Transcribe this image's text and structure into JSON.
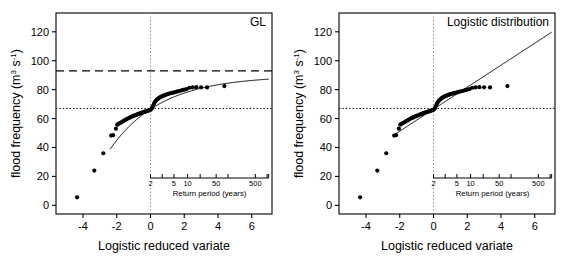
{
  "figure": {
    "width": 566,
    "height": 264,
    "background": "#ffffff",
    "foreground": "#000000"
  },
  "chart_data": [
    {
      "type": "scatter",
      "id": "panel-gl",
      "title": "GL",
      "xlabel": "Logistic reduced variate",
      "ylabel": "flood frequency (m3 s-1)",
      "ylabel_parts": {
        "lead": "flood frequency (m",
        "sup1": "3",
        "mid": " s",
        "sup2": "-1",
        "tail": ")"
      },
      "xlim": [
        -5.6,
        7.2
      ],
      "ylim": [
        -6,
        133
      ],
      "xticks": [
        -4,
        -2,
        0,
        2,
        4,
        6
      ],
      "xticklabels": [
        "-4",
        "-2",
        "0",
        "2",
        "4",
        "6"
      ],
      "yticks": [
        0,
        20,
        40,
        60,
        80,
        100,
        120
      ],
      "yticklabels": [
        "0",
        "20",
        "40",
        "60",
        "80",
        "100",
        "120"
      ],
      "grid": false,
      "legend": "none",
      "reference_lines": [
        {
          "name": "design-flood-dashed",
          "orient": "horizontal",
          "value": 93,
          "style": "dashed"
        },
        {
          "name": "median-flood-dotted",
          "orient": "horizontal",
          "value": 67,
          "style": "dotted"
        },
        {
          "name": "zero-variate-vertical",
          "orient": "vertical",
          "value": 0,
          "style": "dotted"
        }
      ],
      "points": [
        [
          -4.35,
          5.5
        ],
        [
          -3.33,
          24.0
        ],
        [
          -2.8,
          36.0
        ],
        [
          -2.33,
          48.2
        ],
        [
          -2.22,
          48.5
        ],
        [
          -2.05,
          53.0
        ],
        [
          -1.97,
          55.8
        ],
        [
          -1.9,
          56.3
        ],
        [
          -1.8,
          57.0
        ],
        [
          -1.7,
          57.6
        ],
        [
          -1.62,
          58.2
        ],
        [
          -1.54,
          58.7
        ],
        [
          -1.46,
          59.3
        ],
        [
          -1.38,
          59.8
        ],
        [
          -1.31,
          60.2
        ],
        [
          -1.24,
          60.6
        ],
        [
          -1.17,
          61.0
        ],
        [
          -1.1,
          61.4
        ],
        [
          -1.03,
          61.7
        ],
        [
          -0.97,
          62.0
        ],
        [
          -0.9,
          62.3
        ],
        [
          -0.84,
          62.6
        ],
        [
          -0.78,
          62.9
        ],
        [
          -0.72,
          63.1
        ],
        [
          -0.66,
          63.4
        ],
        [
          -0.6,
          63.7
        ],
        [
          -0.54,
          63.9
        ],
        [
          -0.48,
          64.2
        ],
        [
          -0.42,
          64.4
        ],
        [
          -0.37,
          64.6
        ],
        [
          -0.31,
          64.8
        ],
        [
          -0.25,
          65.0
        ],
        [
          -0.2,
          65.3
        ],
        [
          -0.14,
          65.5
        ],
        [
          -0.09,
          65.7
        ],
        [
          -0.03,
          65.9
        ],
        [
          0.03,
          66.3
        ],
        [
          0.08,
          67.2
        ],
        [
          0.14,
          68.6
        ],
        [
          0.2,
          70.0
        ],
        [
          0.25,
          71.2
        ],
        [
          0.31,
          72.2
        ],
        [
          0.37,
          73.0
        ],
        [
          0.43,
          73.6
        ],
        [
          0.49,
          74.1
        ],
        [
          0.55,
          74.6
        ],
        [
          0.62,
          75.0
        ],
        [
          0.68,
          75.4
        ],
        [
          0.75,
          75.8
        ],
        [
          0.82,
          76.1
        ],
        [
          0.89,
          76.4
        ],
        [
          0.96,
          76.7
        ],
        [
          1.03,
          77.0
        ],
        [
          1.11,
          77.3
        ],
        [
          1.19,
          77.5
        ],
        [
          1.27,
          77.8
        ],
        [
          1.36,
          78.0
        ],
        [
          1.45,
          78.3
        ],
        [
          1.55,
          78.6
        ],
        [
          1.65,
          78.9
        ],
        [
          1.76,
          79.2
        ],
        [
          1.88,
          79.6
        ],
        [
          2.0,
          80.0
        ],
        [
          2.14,
          80.4
        ],
        [
          2.3,
          81.3
        ],
        [
          2.5,
          81.5
        ],
        [
          2.72,
          81.7
        ],
        [
          3.0,
          81.6
        ],
        [
          3.35,
          81.5
        ],
        [
          4.38,
          82.5
        ]
      ],
      "fit_curve": {
        "name": "generalised-logistic-fit",
        "kind": "generalised-logistic",
        "location": 66.5,
        "scale": 7.6,
        "shape": 0.33,
        "x_range": [
          -2.4,
          7.0
        ]
      },
      "inset_axis": {
        "name": "return-period-axis",
        "title": "Return period (years)",
        "labels": [
          "2",
          "5",
          "10",
          "50",
          "500"
        ],
        "label_values": [
          2,
          5,
          10,
          50,
          500
        ],
        "tick_values": [
          2,
          3,
          5,
          10,
          20,
          50,
          100,
          500,
          1000
        ],
        "x_start": 0.0,
        "x_end": 7.0
      }
    },
    {
      "type": "scatter",
      "id": "panel-logistic",
      "title": "Logistic distribution",
      "xlabel": "Logistic reduced variate",
      "ylabel": "flood frequency (m3 s-1)",
      "ylabel_parts": {
        "lead": "flood frequency (m",
        "sup1": "3",
        "mid": " s",
        "sup2": "-1",
        "tail": ")"
      },
      "xlim": [
        -5.6,
        7.2
      ],
      "ylim": [
        -6,
        133
      ],
      "xticks": [
        -4,
        -2,
        0,
        2,
        4,
        6
      ],
      "xticklabels": [
        "-4",
        "-2",
        "0",
        "2",
        "4",
        "6"
      ],
      "yticks": [
        0,
        20,
        40,
        60,
        80,
        100,
        120
      ],
      "yticklabels": [
        "0",
        "20",
        "40",
        "60",
        "80",
        "100",
        "120"
      ],
      "grid": false,
      "legend": "none",
      "reference_lines": [
        {
          "name": "median-flood-dotted",
          "orient": "horizontal",
          "value": 67,
          "style": "dotted"
        },
        {
          "name": "zero-variate-vertical",
          "orient": "vertical",
          "value": 0,
          "style": "dotted"
        }
      ],
      "points": [
        [
          -4.35,
          5.5
        ],
        [
          -3.33,
          24.0
        ],
        [
          -2.8,
          36.0
        ],
        [
          -2.33,
          48.2
        ],
        [
          -2.22,
          48.5
        ],
        [
          -2.05,
          53.0
        ],
        [
          -1.97,
          55.8
        ],
        [
          -1.9,
          56.3
        ],
        [
          -1.8,
          57.0
        ],
        [
          -1.7,
          57.6
        ],
        [
          -1.62,
          58.2
        ],
        [
          -1.54,
          58.7
        ],
        [
          -1.46,
          59.3
        ],
        [
          -1.38,
          59.8
        ],
        [
          -1.31,
          60.2
        ],
        [
          -1.24,
          60.6
        ],
        [
          -1.17,
          61.0
        ],
        [
          -1.1,
          61.4
        ],
        [
          -1.03,
          61.7
        ],
        [
          -0.97,
          62.0
        ],
        [
          -0.9,
          62.3
        ],
        [
          -0.84,
          62.6
        ],
        [
          -0.78,
          62.9
        ],
        [
          -0.72,
          63.1
        ],
        [
          -0.66,
          63.4
        ],
        [
          -0.6,
          63.7
        ],
        [
          -0.54,
          63.9
        ],
        [
          -0.48,
          64.2
        ],
        [
          -0.42,
          64.4
        ],
        [
          -0.37,
          64.6
        ],
        [
          -0.31,
          64.8
        ],
        [
          -0.25,
          65.0
        ],
        [
          -0.2,
          65.3
        ],
        [
          -0.14,
          65.5
        ],
        [
          -0.09,
          65.7
        ],
        [
          -0.03,
          65.9
        ],
        [
          0.03,
          66.3
        ],
        [
          0.08,
          67.2
        ],
        [
          0.14,
          68.6
        ],
        [
          0.2,
          70.0
        ],
        [
          0.25,
          71.2
        ],
        [
          0.31,
          72.2
        ],
        [
          0.37,
          73.0
        ],
        [
          0.43,
          73.6
        ],
        [
          0.49,
          74.1
        ],
        [
          0.55,
          74.6
        ],
        [
          0.62,
          75.0
        ],
        [
          0.68,
          75.4
        ],
        [
          0.75,
          75.8
        ],
        [
          0.82,
          76.1
        ],
        [
          0.89,
          76.4
        ],
        [
          0.96,
          76.7
        ],
        [
          1.03,
          77.0
        ],
        [
          1.11,
          77.3
        ],
        [
          1.19,
          77.5
        ],
        [
          1.27,
          77.8
        ],
        [
          1.36,
          78.0
        ],
        [
          1.45,
          78.3
        ],
        [
          1.55,
          78.6
        ],
        [
          1.65,
          78.9
        ],
        [
          1.76,
          79.2
        ],
        [
          1.88,
          79.6
        ],
        [
          2.0,
          80.0
        ],
        [
          2.14,
          80.4
        ],
        [
          2.3,
          81.3
        ],
        [
          2.5,
          81.5
        ],
        [
          2.72,
          81.7
        ],
        [
          3.0,
          81.6
        ],
        [
          3.35,
          81.5
        ],
        [
          4.38,
          82.5
        ]
      ],
      "fit_curve": {
        "name": "logistic-fit",
        "kind": "logistic-straight-line",
        "location": 66.5,
        "scale": 7.6,
        "x_range": [
          -2.4,
          7.0
        ]
      },
      "inset_axis": {
        "name": "return-period-axis",
        "title": "Return period (years)",
        "labels": [
          "2",
          "5",
          "10",
          "50",
          "500"
        ],
        "label_values": [
          2,
          5,
          10,
          50,
          500
        ],
        "tick_values": [
          2,
          3,
          5,
          10,
          20,
          50,
          100,
          500,
          1000
        ],
        "x_start": 0.0,
        "x_end": 7.0
      }
    }
  ]
}
